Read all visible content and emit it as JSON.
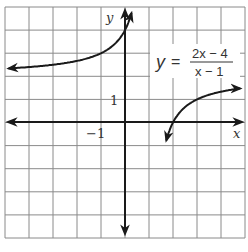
{
  "chart_data": {
    "type": "line",
    "title": "",
    "equation": {
      "lhs": "y",
      "equals": "=",
      "numerator": "2x − 4",
      "denominator": "x − 1"
    },
    "xlabel": "x",
    "ylabel": "y",
    "xlim": [
      -5,
      5
    ],
    "ylim": [
      -5,
      5
    ],
    "grid": true,
    "tick_labels": {
      "x": [
        {
          "value": -1,
          "label": "−1"
        }
      ],
      "y": [
        {
          "value": 1,
          "label": "1"
        }
      ]
    },
    "asymptotes": {
      "vertical": 1,
      "horizontal": 2
    },
    "series": [
      {
        "name": "left branch",
        "x": [
          -5,
          -4,
          -3,
          -2,
          -1,
          -0.5,
          0,
          0.2
        ],
        "y": [
          2.33,
          2.4,
          2.5,
          2.67,
          3,
          3.33,
          4,
          4.5
        ]
      },
      {
        "name": "right branch",
        "x": [
          1.1,
          1.2,
          1.5,
          2,
          3,
          4,
          5
        ],
        "y": [
          -18,
          -8,
          -2,
          0,
          1,
          1.33,
          1.5
        ]
      }
    ]
  }
}
